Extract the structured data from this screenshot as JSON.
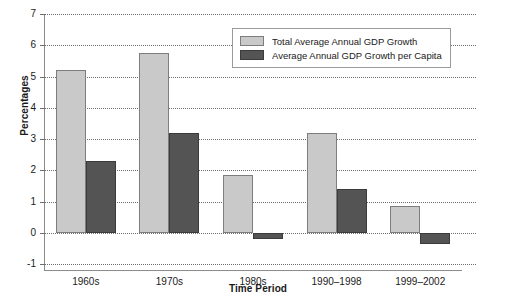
{
  "chart_data": {
    "type": "bar",
    "title": "",
    "xlabel": "Time Period",
    "ylabel": "Percentages",
    "categories": [
      "1960s",
      "1970s",
      "1980s",
      "1990–1998",
      "1999–2002"
    ],
    "series": [
      {
        "name": "Total Average Annual GDP Growth",
        "color": "#c9c9c9",
        "values": [
          5.2,
          5.75,
          1.85,
          3.2,
          0.85
        ]
      },
      {
        "name": "Average Annual GDP Growth per Capita",
        "color": "#545454",
        "values": [
          2.3,
          3.2,
          -0.2,
          1.4,
          -0.35
        ]
      }
    ],
    "ylim": [
      -1,
      7
    ],
    "yticks": [
      7,
      6,
      5,
      4,
      3,
      2,
      1,
      0,
      -1
    ],
    "ytick_labels": [
      "7",
      "6",
      "5",
      "4",
      "3",
      "2",
      "1",
      "0",
      "-1"
    ],
    "grid": true,
    "grid_style": "dotted",
    "legend_position": "top-right"
  },
  "legend": {
    "entries": [
      {
        "label": "Total Average Annual GDP Growth"
      },
      {
        "label": "Average Annual GDP Growth per Capita"
      }
    ]
  }
}
